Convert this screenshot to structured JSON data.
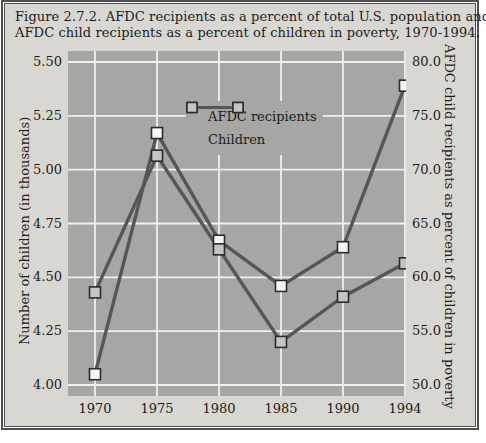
{
  "figure": {
    "title_lines": [
      "Figure 2.7.2. AFDC recipients as a percent of total U.S. population and",
      "AFDC child recipients as a percent of children in poverty, 1970-1994."
    ]
  },
  "chart_data": {
    "type": "line",
    "title": "AFDC recipients as a percent of total U.S. population and AFDC child recipients as a percent of children in poverty, 1970-1994",
    "categories": [
      "1970",
      "1975",
      "1980",
      "1985",
      "1990",
      "1994"
    ],
    "series": [
      {
        "name": "AFDC recipients",
        "axis": "left",
        "marker": "white-square",
        "values": [
          4.05,
          5.17,
          4.67,
          4.46,
          4.64,
          5.39
        ]
      },
      {
        "name": "Children",
        "axis": "right",
        "marker": "gray-square",
        "values": [
          58.6,
          71.3,
          62.6,
          54.0,
          58.2,
          61.3
        ]
      }
    ],
    "left_axis": {
      "label": "Number of children (in thousands)",
      "ticks": [
        "5.50",
        "5.25",
        "5.00",
        "4.75",
        "4.50",
        "4.25",
        "4.00"
      ],
      "min": 4.0,
      "max": 5.5
    },
    "right_axis": {
      "label": "AFDC child recipients as percent of children in poverty",
      "ticks": [
        "80.0",
        "75.0",
        "70.0",
        "65.0",
        "60.0",
        "55.0",
        "50.0"
      ],
      "min": 50.0,
      "max": 80.0
    },
    "legend": {
      "position": "inside-top",
      "entries": [
        "AFDC recipients",
        "Children"
      ]
    },
    "grid": true
  },
  "colors": {
    "figure_bg": "#d8d7d2",
    "plot_bg": "#a6a6a4",
    "grid": "#f0f0ee",
    "line": "#565656",
    "marker_white_fill": "#f7f7f5",
    "marker_gray_fill": "#c5c5c2",
    "marker_border": "#2b2b2b",
    "text": "#1d1d1d",
    "frame": "#4f4f4f"
  }
}
